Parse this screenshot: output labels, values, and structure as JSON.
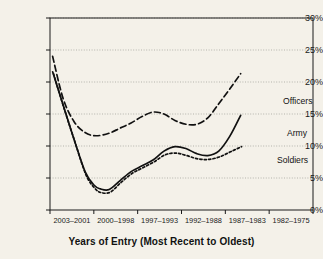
{
  "chart_data": {
    "type": "line",
    "title": "",
    "xlabel": "Years of Entry (Most Recent to Oldest)",
    "ylabel": "",
    "ylim": [
      0,
      30
    ],
    "yticks": [
      0,
      5,
      10,
      15,
      20,
      25,
      30
    ],
    "ytick_labels": [
      "0%",
      "5%",
      "10%",
      "15%",
      "20%",
      "25%",
      "30%"
    ],
    "grid": true,
    "grid_style": "dotted-horizontal",
    "legend_position": "inline-right",
    "categories": [
      "2003–2001",
      "2000–1998",
      "1997–1993",
      "1992–1988",
      "1987–1983",
      "1982–1975"
    ],
    "series": [
      {
        "name": "Officers",
        "style": "dashed",
        "values": [
          24.0,
          12.2,
          12.6,
          15.3,
          13.4,
          21.3
        ],
        "points": [
          [
            0.06,
            24.0
          ],
          [
            0.3,
            17.4
          ],
          [
            0.55,
            13.8
          ],
          [
            0.8,
            12.1
          ],
          [
            1.05,
            11.6
          ],
          [
            1.35,
            12.0
          ],
          [
            1.6,
            12.8
          ],
          [
            1.85,
            13.6
          ],
          [
            2.1,
            14.6
          ],
          [
            2.35,
            15.3
          ],
          [
            2.6,
            15.0
          ],
          [
            2.85,
            14.0
          ],
          [
            3.1,
            13.4
          ],
          [
            3.35,
            13.4
          ],
          [
            3.6,
            14.4
          ],
          [
            3.85,
            16.6
          ],
          [
            4.1,
            18.9
          ],
          [
            4.35,
            21.3
          ]
        ]
      },
      {
        "name": "Army",
        "style": "solid",
        "values": [
          21.6,
          3.2,
          7.2,
          9.9,
          8.5,
          14.8
        ],
        "points": [
          [
            0.06,
            21.6
          ],
          [
            0.3,
            16.4
          ],
          [
            0.55,
            11.0
          ],
          [
            0.8,
            6.0
          ],
          [
            1.0,
            3.9
          ],
          [
            1.15,
            3.3
          ],
          [
            1.35,
            3.2
          ],
          [
            1.6,
            4.6
          ],
          [
            1.85,
            6.0
          ],
          [
            2.1,
            6.9
          ],
          [
            2.35,
            7.8
          ],
          [
            2.6,
            9.2
          ],
          [
            2.85,
            9.9
          ],
          [
            3.1,
            9.6
          ],
          [
            3.35,
            8.8
          ],
          [
            3.6,
            8.5
          ],
          [
            3.85,
            9.2
          ],
          [
            4.1,
            11.5
          ],
          [
            4.35,
            14.8
          ]
        ]
      },
      {
        "name": "Soldiers",
        "style": "dotted",
        "values": [
          21.5,
          2.7,
          6.9,
          8.9,
          7.9,
          9.9
        ],
        "points": [
          [
            0.08,
            21.3
          ],
          [
            0.32,
            15.9
          ],
          [
            0.57,
            10.6
          ],
          [
            0.82,
            5.5
          ],
          [
            1.02,
            3.4
          ],
          [
            1.18,
            2.7
          ],
          [
            1.38,
            2.8
          ],
          [
            1.62,
            4.3
          ],
          [
            1.87,
            5.7
          ],
          [
            2.12,
            6.6
          ],
          [
            2.37,
            7.5
          ],
          [
            2.62,
            8.6
          ],
          [
            2.87,
            8.9
          ],
          [
            3.12,
            8.5
          ],
          [
            3.37,
            8.0
          ],
          [
            3.62,
            7.9
          ],
          [
            3.87,
            8.3
          ],
          [
            4.12,
            9.1
          ],
          [
            4.37,
            9.9
          ]
        ]
      }
    ],
    "inline_labels": [
      {
        "text": "Officers",
        "series": "Officers",
        "x_px": 283,
        "y_px": 96
      },
      {
        "text": "Army",
        "series": "Army",
        "x_px": 287,
        "y_px": 128
      },
      {
        "text": "Soldiers",
        "series": "Soldiers",
        "x_px": 277,
        "y_px": 155
      }
    ],
    "colors": {
      "background": "#f4f1e9",
      "axis": "#1a1a1a",
      "grid": "#9a9a93",
      "officers": "#111111",
      "army": "#111111",
      "soldiers": "#111111"
    }
  }
}
